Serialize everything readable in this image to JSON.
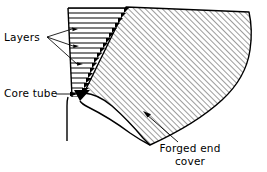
{
  "diagram": {
    "type": "engineering-cross-section",
    "background_color": "#ffffff",
    "line_color": "#000000",
    "hatch_color": "#555555",
    "wedge_fill": "#000000"
  },
  "labels": {
    "layers": "Layers",
    "core_tube": "Core tube",
    "forged_end_cover_line1": "Forged  end",
    "forged_end_cover_line2": "cover"
  },
  "annotations": [
    {
      "name": "layers",
      "text": "Layers",
      "text_x": 4,
      "text_y": 41,
      "leader_origin": [
        47,
        37
      ],
      "arrow_targets": [
        [
          75,
          29
        ],
        [
          76,
          46
        ],
        [
          80,
          64
        ]
      ]
    },
    {
      "name": "core-tube",
      "text": "Core tube",
      "text_x": 4,
      "text_y": 97,
      "leader_origin": [
        60,
        94
      ],
      "arrow_targets": [
        [
          76,
          94
        ]
      ]
    },
    {
      "name": "forged-end-cover",
      "text_line1": "Forged  end",
      "text_line2": "cover",
      "text_x": 190,
      "text_y1": 152,
      "text_y2": 165,
      "leader_origin": [
        178,
        142
      ],
      "arrow_targets": [
        [
          145,
          114
        ]
      ]
    }
  ],
  "geometry": {
    "layer_count": 18,
    "layer_band_height": 5,
    "layer_stack_top_y": 8,
    "layer_stack_bottom_y": 97,
    "layer_left_x_top": 68,
    "layer_left_x_bottom": 72,
    "taper_top_x": 126,
    "taper_bottom_x": 78,
    "hatch_angle_deg": 45,
    "hatch_spacing_px": 4,
    "cover_right_extent_x": 250,
    "cover_bottom_corner": [
      145,
      145
    ],
    "core_tube_triangle": [
      [
        74,
        91
      ],
      [
        90,
        91
      ],
      [
        80,
        101
      ]
    ],
    "core_tube_stem_x": 68,
    "core_tube_stem_bottom_y": 141
  }
}
